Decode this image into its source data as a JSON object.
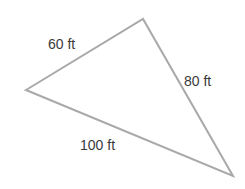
{
  "diagram": {
    "type": "triangle",
    "stroke_color": "#a9a9a9",
    "text_color": "#3a3a3a",
    "vertices": {
      "left": [
        26,
        90
      ],
      "top": [
        143,
        19
      ],
      "bottom_right": [
        233,
        176
      ]
    },
    "sides": [
      {
        "id": "left-top",
        "label": "60 ft",
        "length": 60
      },
      {
        "id": "top-bottom-right",
        "label": "80 ft",
        "length": 80
      },
      {
        "id": "left-bottom-right",
        "label": "100 ft",
        "length": 100
      }
    ]
  }
}
